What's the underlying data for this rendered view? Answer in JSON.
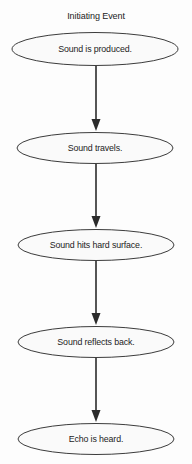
{
  "diagram": {
    "title": "Initiating Event",
    "type": "flowchart",
    "orientation": "vertical",
    "background_color": "#fdfdfd",
    "node_fill_color": "#fafafa",
    "node_stroke_color": "#3c3c3c",
    "connector_color": "#2b2b2b",
    "text_color": "#1c1c1c",
    "nodes": [
      {
        "id": "node-1",
        "label": "Sound is produced.",
        "shape": "ellipse",
        "cx": 95,
        "cy": 49,
        "rx": 83,
        "ry": 16.5
      },
      {
        "id": "node-2",
        "label": "Sound travels.",
        "shape": "ellipse",
        "cx": 95,
        "cy": 148,
        "rx": 78,
        "ry": 15.5
      },
      {
        "id": "node-3",
        "label": "Sound hits hard surface.",
        "shape": "ellipse",
        "cx": 96,
        "cy": 245,
        "rx": 78,
        "ry": 15.5
      },
      {
        "id": "node-4",
        "label": "Sound reflects back.",
        "shape": "ellipse",
        "cx": 96,
        "cy": 342,
        "rx": 78,
        "ry": 15.5
      },
      {
        "id": "node-5",
        "label": "Echo is heard.",
        "shape": "ellipse",
        "cx": 96,
        "cy": 439,
        "rx": 78,
        "ry": 15.5
      }
    ],
    "connectors": [
      {
        "id": "arrow-1",
        "from": "node-1",
        "to": "node-2",
        "x": 96,
        "y_start": 66,
        "y_end": 131
      },
      {
        "id": "arrow-2",
        "from": "node-2",
        "to": "node-3",
        "x": 96,
        "y_start": 164,
        "y_end": 228
      },
      {
        "id": "arrow-3",
        "from": "node-3",
        "to": "node-4",
        "x": 96,
        "y_start": 261,
        "y_end": 325
      },
      {
        "id": "arrow-4",
        "from": "node-4",
        "to": "node-5",
        "x": 96,
        "y_start": 358,
        "y_end": 422
      }
    ]
  }
}
